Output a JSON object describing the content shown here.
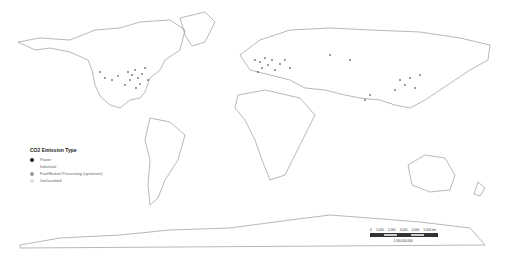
{
  "map": {
    "type": "world choropleth outline with point emissions sources",
    "outline_color": "#888888",
    "point_color": "#222222"
  },
  "legend": {
    "title": "CO2 Emission Type",
    "items": [
      {
        "label": "Power",
        "color": "#222222",
        "symbol": "filled-circle"
      },
      {
        "label": "Industrial",
        "color": "#ffffff",
        "symbol": "none"
      },
      {
        "label": "Fuel/Biofuel Processing (upstream)",
        "color": "#999999",
        "symbol": "filled-circle"
      },
      {
        "label": "Unclassified",
        "color": "#e0e0e0",
        "symbol": "filled-circle"
      }
    ]
  },
  "scalebar": {
    "ticks": [
      "0",
      "1,000",
      "2,000",
      "3,000",
      "4,000",
      "5,000 km"
    ],
    "ratio": "1:100,000,000"
  }
}
